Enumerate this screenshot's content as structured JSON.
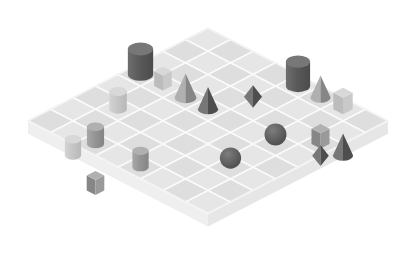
{
  "scene": {
    "title": "Isometric 3D shape grid scene",
    "background_color": "#ffffff",
    "width": 416,
    "height": 273,
    "projection": "isometric",
    "platform": {
      "name": "grid-platform",
      "grid_columns": 8,
      "grid_rows": 8,
      "top_color": "#e2e2e2",
      "grid_line_color": "#fbfbfb",
      "left_side_color": "#efefef",
      "right_side_color": "#e6e6e6",
      "slab_thickness_px": 13,
      "origin_x": 208,
      "origin_y": 28,
      "tile_half_width": 22.5,
      "tile_half_height": 11.6
    },
    "palette": {
      "dark": "#5e5e5e",
      "dark_side": "#4e4e4e",
      "dark_top": "#777777",
      "mid": "#9a9a9a",
      "mid_side": "#868686",
      "mid_top": "#b0b0b0",
      "light": "#c9c9c9",
      "light_side": "#bcbcbc",
      "light_top": "#d8d8d8"
    },
    "object_count": 18,
    "objects": [
      {
        "name": "cylinder-dark-left",
        "shape": "cylinder",
        "tone": "dark",
        "col": 0,
        "row": 3,
        "size": 1.15,
        "label": "Dark cylinder"
      },
      {
        "name": "cube-light-left",
        "shape": "cube",
        "tone": "light",
        "col": 1,
        "row": 3,
        "size": 0.8,
        "label": "Light cube"
      },
      {
        "name": "cone-mid-left",
        "shape": "cone",
        "tone": "mid",
        "col": 2,
        "row": 3,
        "size": 1.0,
        "label": "Gray cone"
      },
      {
        "name": "cylinder-light-left",
        "shape": "cylinder",
        "tone": "light",
        "col": 1,
        "row": 5,
        "size": 0.8,
        "label": "Light cylinder"
      },
      {
        "name": "cylinder-dark-front-a",
        "shape": "cylinder",
        "tone": "mid",
        "col": 2,
        "row": 7,
        "size": 0.78,
        "label": "Gray cylinder"
      },
      {
        "name": "cylinder-light-front",
        "shape": "cylinder",
        "tone": "light",
        "col": 2,
        "row": 8,
        "size": 0.74,
        "label": "Light cylinder"
      },
      {
        "name": "cylinder-dark-front-b",
        "shape": "cylinder",
        "tone": "mid",
        "col": 4,
        "row": 7,
        "size": 0.74,
        "label": "Gray cylinder"
      },
      {
        "name": "cylinder-dark-top",
        "shape": "cylinder",
        "tone": "dark",
        "col": 4,
        "row": 0,
        "size": 1.1,
        "label": "Dark cylinder"
      },
      {
        "name": "cone-mid-top",
        "shape": "cone",
        "tone": "mid",
        "col": 5,
        "row": 0,
        "size": 0.92,
        "label": "Gray cone"
      },
      {
        "name": "cube-light-top",
        "shape": "cube",
        "tone": "light",
        "col": 6,
        "row": 0,
        "size": 0.88,
        "label": "Light cube"
      },
      {
        "name": "octahedron-dark-mid",
        "shape": "octahedron",
        "tone": "dark",
        "col": 4,
        "row": 2,
        "size": 1.0,
        "label": "Dark octahedron"
      },
      {
        "name": "cone-dark-mid",
        "shape": "cone",
        "tone": "dark",
        "col": 3,
        "row": 3,
        "size": 0.92,
        "label": "Dark cone"
      },
      {
        "name": "sphere-dark-right-a",
        "shape": "sphere",
        "tone": "dark",
        "col": 6,
        "row": 3,
        "size": 0.95,
        "label": "Dark sphere"
      },
      {
        "name": "cube-mid-right",
        "shape": "cube",
        "tone": "mid",
        "col": 7,
        "row": 2,
        "size": 0.82,
        "label": "Gray cube"
      },
      {
        "name": "octahedron-dark-right",
        "shape": "octahedron",
        "tone": "dark",
        "col": 8,
        "row": 3,
        "size": 0.92,
        "label": "Dark octahedron"
      },
      {
        "name": "cone-dark-right",
        "shape": "cone",
        "tone": "dark",
        "col": 8,
        "row": 2,
        "size": 0.92,
        "label": "Dark cone"
      },
      {
        "name": "sphere-dark-right-b",
        "shape": "sphere",
        "tone": "dark",
        "col": 6,
        "row": 5,
        "size": 0.92,
        "label": "Dark sphere"
      },
      {
        "name": "cube-mid-front",
        "shape": "cube",
        "tone": "mid",
        "col": 4,
        "row": 9,
        "size": 0.8,
        "label": "Gray cube"
      }
    ]
  }
}
